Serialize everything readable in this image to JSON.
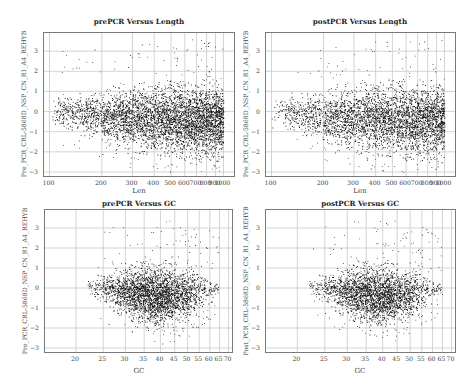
{
  "chart_data": [
    {
      "id": "pre_len",
      "type": "scatter",
      "title": "prePCR Versus Length",
      "xlabel": "Len",
      "ylabel": "Pre_PCR_CRL-5868D_NSP_CN_R1_A4_REHYB",
      "xscale": "log",
      "xlim": [
        93,
        1150
      ],
      "ylim": [
        -3.2,
        3.9
      ],
      "xticks": [
        100,
        200,
        300,
        400,
        500,
        600,
        700,
        800,
        900,
        1000
      ],
      "xtick_labels": [
        "100",
        "200",
        "300",
        "400",
        "500",
        "600",
        "700",
        "800",
        "900",
        "1000"
      ],
      "yticks": [
        -3,
        -2,
        -1,
        0,
        1,
        2,
        3
      ],
      "grid": true,
      "description": "Dense funnel-shaped point cloud; spread widens from about ±0.7 at Len 100 to about -2.3..1.3 at Len 500-1000; sparse outliers up to ~3.7 and down to ~-3",
      "envelope": {
        "x": [
          100,
          150,
          200,
          300,
          500,
          700,
          1000
        ],
        "y_low": [
          -0.7,
          -1.0,
          -1.5,
          -1.9,
          -2.1,
          -2.2,
          -2.2
        ],
        "y_high": [
          0.7,
          0.8,
          1.0,
          1.2,
          1.3,
          1.3,
          1.3
        ]
      }
    },
    {
      "id": "post_len",
      "type": "scatter",
      "title": "postPCR Versus Length",
      "xlabel": "Len",
      "ylabel": "Pre_PCR_CRL-5868D_NSP_CN_R1_A4_REHYB",
      "xscale": "log",
      "xlim": [
        93,
        1150
      ],
      "ylim": [
        -3.2,
        3.9
      ],
      "xticks": [
        100,
        200,
        300,
        400,
        500,
        600,
        700,
        800,
        900,
        1000
      ],
      "xtick_labels": [
        "100",
        "200",
        "300",
        "400",
        "500",
        "600",
        "700",
        "800",
        "900",
        "1000"
      ],
      "yticks": [
        -3,
        -2,
        -1,
        0,
        1,
        2,
        3
      ],
      "grid": true,
      "description": "Funnel-shaped point cloud similar to prePCR; outliers up to ~3.7",
      "envelope": {
        "x": [
          100,
          150,
          200,
          300,
          500,
          700,
          1000
        ],
        "y_low": [
          -0.7,
          -1.0,
          -1.5,
          -1.9,
          -2.1,
          -2.2,
          -2.2
        ],
        "y_high": [
          0.7,
          0.8,
          1.0,
          1.2,
          1.3,
          1.3,
          1.3
        ]
      }
    },
    {
      "id": "pre_gc",
      "type": "scatter",
      "title": "prePCR Versus GC",
      "xlabel": "GC",
      "ylabel": "Pre_PCR_CRL-5868D_NSP_CN_R1_A4_REHYB",
      "xscale": "log",
      "xlim": [
        15.5,
        72
      ],
      "ylim": [
        -3.2,
        3.9
      ],
      "xticks": [
        20,
        25,
        30,
        35,
        40,
        45,
        50,
        55,
        60,
        65,
        70
      ],
      "xtick_labels": [
        "20",
        "25",
        "30",
        "35",
        "40",
        "45",
        "50",
        "55",
        "60",
        "65",
        "70"
      ],
      "yticks": [
        -3,
        -2,
        -1,
        0,
        1,
        2,
        3
      ],
      "grid": true,
      "description": "Oval dense cloud centered near GC 40, y 0, from GC ~22 to ~66; outliers up to ~3.7",
      "envelope": {
        "x": [
          22,
          25,
          30,
          35,
          40,
          45,
          50,
          55,
          60,
          65
        ],
        "y_low": [
          -0.3,
          -0.8,
          -1.4,
          -1.8,
          -1.9,
          -1.8,
          -1.6,
          -1.2,
          -0.7,
          -0.2
        ],
        "y_high": [
          0.4,
          0.8,
          1.0,
          1.1,
          1.1,
          1.1,
          1.0,
          0.9,
          0.6,
          0.3
        ]
      }
    },
    {
      "id": "post_gc",
      "type": "scatter",
      "title": "postPCR Versus GC",
      "xlabel": "GC",
      "ylabel": "Post_PCR_CRL-5868D_NSP_CN_R1_A4_REHYB",
      "xscale": "log",
      "xlim": [
        15.5,
        72
      ],
      "ylim": [
        -3.2,
        3.9
      ],
      "xticks": [
        20,
        25,
        30,
        35,
        40,
        45,
        50,
        55,
        60,
        65,
        70
      ],
      "xtick_labels": [
        "20",
        "25",
        "30",
        "35",
        "40",
        "45",
        "50",
        "55",
        "60",
        "65",
        "70"
      ],
      "yticks": [
        -3,
        -2,
        -1,
        0,
        1,
        2,
        3
      ],
      "grid": true,
      "description": "Oval dense cloud centered near GC 40, y 0; outliers up to ~3.7",
      "envelope": {
        "x": [
          22,
          25,
          30,
          35,
          40,
          45,
          50,
          55,
          60,
          65
        ],
        "y_low": [
          -0.3,
          -0.8,
          -1.4,
          -1.8,
          -1.9,
          -1.8,
          -1.6,
          -1.2,
          -0.7,
          -0.2
        ],
        "y_high": [
          0.4,
          0.8,
          1.0,
          1.1,
          1.1,
          1.1,
          1.0,
          0.9,
          0.6,
          0.3
        ]
      }
    }
  ],
  "panels": [
    {
      "title": "prePCR Versus Length",
      "xlabel": "Len",
      "ylabel": "Pre_PCR_CRL-5868D_NSP_CN_R1_A4_REHYB"
    },
    {
      "title": "postPCR Versus Length",
      "xlabel": "Len",
      "ylabel": "Pre_PCR_CRL-5868D_NSP_CN_R1_A4_REHYB"
    },
    {
      "title": "prePCR Versus GC",
      "xlabel": "GC",
      "ylabel": "Pre_PCR_CRL-5868D_NSP_CN_R1_A4_REHYB"
    },
    {
      "title": "postPCR Versus GC",
      "xlabel": "GC",
      "ylabel": "Post_PCR_CRL-5868D_NSP_CN_R1_A4_REHYB"
    }
  ]
}
